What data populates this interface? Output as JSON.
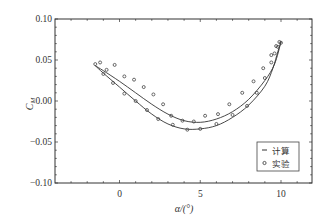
{
  "chart_data": {
    "type": "line",
    "title": "",
    "xlabel": "α/(°)",
    "ylabel": "C_M",
    "xlim": [
      -4,
      12
    ],
    "ylim": [
      -0.1,
      0.1
    ],
    "xticks": [
      0,
      5,
      10
    ],
    "yticks": [
      -0.1,
      -0.05,
      0.0,
      0.05,
      0.1
    ],
    "xtick_labels": [
      "0",
      "5",
      "10"
    ],
    "ytick_labels": [
      "−0.10",
      "−0.05",
      "0.00",
      "0.05",
      "0.10"
    ],
    "grid": false,
    "legend_position": "lower right",
    "series": [
      {
        "name": "计算",
        "style": "line",
        "branch_upstroke": {
          "x": [
            -1.5,
            -1.0,
            0.0,
            1.0,
            2.0,
            3.0,
            4.0,
            5.0,
            6.0,
            7.0,
            8.0,
            9.0,
            9.6,
            10.0
          ],
          "y": [
            0.043,
            0.037,
            0.024,
            0.01,
            -0.004,
            -0.016,
            -0.024,
            -0.026,
            -0.022,
            -0.013,
            0.002,
            0.025,
            0.045,
            0.072
          ]
        },
        "branch_downstroke": {
          "x": [
            10.0,
            9.8,
            9.5,
            9.0,
            8.0,
            7.0,
            6.0,
            5.0,
            4.0,
            3.0,
            2.0,
            1.0,
            0.0,
            -1.0,
            -1.5
          ],
          "y": [
            0.072,
            0.06,
            0.04,
            0.018,
            -0.005,
            -0.02,
            -0.03,
            -0.034,
            -0.034,
            -0.028,
            -0.016,
            0.0,
            0.017,
            0.034,
            0.043
          ]
        }
      },
      {
        "name": "实验",
        "style": "markers",
        "x": [
          -1.5,
          -1.2,
          -0.8,
          -0.3,
          0.3,
          0.9,
          1.5,
          2.1,
          2.7,
          3.2,
          3.9,
          4.6,
          5.3,
          6.1,
          6.8,
          7.6,
          8.3,
          8.9,
          9.4,
          9.7,
          9.9,
          10.0,
          9.8,
          9.6,
          9.4,
          9.0,
          8.5,
          7.9,
          7.0,
          6.0,
          5.0,
          4.2,
          3.3,
          2.4,
          1.7,
          1.0,
          0.3,
          -0.4,
          -1.0
        ],
        "y": [
          0.045,
          0.047,
          0.038,
          0.044,
          0.03,
          0.026,
          0.017,
          0.008,
          -0.004,
          -0.018,
          -0.024,
          -0.025,
          -0.018,
          -0.016,
          -0.004,
          0.01,
          0.024,
          0.04,
          0.056,
          0.067,
          0.072,
          0.071,
          0.066,
          0.058,
          0.047,
          0.028,
          0.01,
          -0.006,
          -0.017,
          -0.028,
          -0.034,
          -0.035,
          -0.029,
          -0.022,
          -0.011,
          0.0,
          0.009,
          0.022,
          0.033
        ]
      }
    ]
  },
  "legend": {
    "items": [
      {
        "symbol": "line",
        "label": "计算"
      },
      {
        "symbol": "circle",
        "label": "实验"
      }
    ]
  },
  "axes": {
    "xlabel": "α/(°)",
    "ylabel_main": "C",
    "ylabel_sub": "M"
  }
}
